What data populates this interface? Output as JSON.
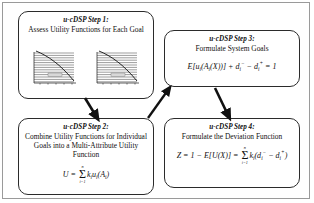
{
  "figure": {
    "type": "flow-diagram",
    "background_color": "#ffffff",
    "box_border_color": "#2b2b2b",
    "frame_color": "#9a9a9a",
    "arrow_color": "#111111"
  },
  "steps": [
    {
      "id": "step1",
      "title": "u-cDSP Step 1:",
      "body": "Assess Utility Functions for Each Goal",
      "has_charts": true
    },
    {
      "id": "step2",
      "title": "u-cDSP Step 2:",
      "body": "Combine Utility Functions for Individual Goals into a Multi-Attribute Utility Function",
      "formula": "U = Σ kᵢuᵢ(Aᵢ)"
    },
    {
      "id": "step3",
      "title": "u-cDSP Step 3:",
      "body": "Formulate System Goals",
      "formula": "E[uᵢ(Aᵢ(X))] + dᵢ⁻ − dᵢ⁺ = 1"
    },
    {
      "id": "step4",
      "title": "u-cDSP Step 4:",
      "body": "Formulate the Deviation Function",
      "formula": "Z = 1 − E[U(X)] = Σ kᵢ(dᵢ⁻ − dᵢ⁺)"
    }
  ],
  "formula_parts": {
    "step2": {
      "lhs": "U",
      "equals": "=",
      "sum_top": "n",
      "sum_bottom": "i=1",
      "term_k": "k",
      "term_k_sub": "i",
      "term_u": "u",
      "term_u_sub": "i",
      "term_arg_open": "(A",
      "term_arg_sub": "i",
      "term_arg_close": ")"
    },
    "step3": {
      "e_open": "E[u",
      "e_sub1": "i",
      "a_open": "(A",
      "a_sub": "i",
      "x_part": "(X))]",
      "plus": "+",
      "d_minus": "d",
      "d_minus_sub": "i",
      "d_minus_sup": "−",
      "minus": "−",
      "d_plus": "d",
      "d_plus_sub": "i",
      "d_plus_sup": "+",
      "equals_one": "= 1"
    },
    "step4": {
      "z": "Z",
      "eq1": "= 1 −",
      "eu": "E[U(X)]",
      "eq2": "=",
      "sum_top": "n",
      "sum_bottom": "i=1",
      "k": "k",
      "k_sub": "i",
      "open": "(d",
      "d1_sub": "i",
      "d1_sup": "−",
      "mid": "−",
      "d2": "d",
      "d2_sub": "i",
      "d2_sup": "+",
      "close": ")"
    }
  },
  "charts": [
    {
      "name": "utility-curve-left",
      "type": "line",
      "x": [
        0,
        1,
        2,
        3,
        4,
        5,
        6,
        7,
        8,
        9,
        10
      ],
      "y": [
        1.0,
        0.97,
        0.93,
        0.87,
        0.79,
        0.7,
        0.59,
        0.47,
        0.33,
        0.18,
        0.0
      ],
      "xlabel": "",
      "ylabel": "",
      "grid": true,
      "gridlines": 14,
      "legend": "utility"
    },
    {
      "name": "utility-curve-right",
      "type": "line",
      "x": [
        0,
        1,
        2,
        3,
        4,
        5,
        6,
        7,
        8,
        9,
        10
      ],
      "y": [
        1.0,
        0.96,
        0.91,
        0.85,
        0.77,
        0.68,
        0.57,
        0.45,
        0.31,
        0.16,
        0.0
      ],
      "xlabel": "",
      "ylabel": "",
      "grid": true,
      "gridlines": 14,
      "legend": "utility"
    }
  ],
  "arrows": [
    {
      "name": "arrow-step1-to-step2",
      "from": "step1",
      "to": "step2"
    },
    {
      "name": "arrow-step2-to-step3",
      "from": "step2",
      "to": "step3"
    },
    {
      "name": "arrow-step3-to-step4",
      "from": "step3",
      "to": "step4"
    }
  ]
}
